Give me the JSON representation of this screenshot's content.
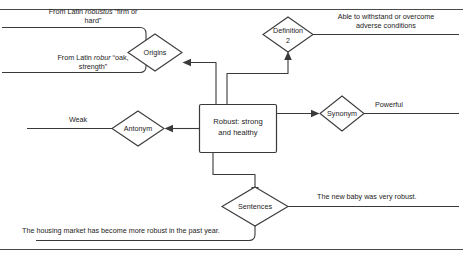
{
  "diagram": {
    "type": "concept-map",
    "stroke_color": "#3a3a3a",
    "background_color": "#ffffff",
    "center": {
      "label_line1": "Robust: strong",
      "label_line2": "and healthy",
      "full_label": "Robust: strong and healthy"
    },
    "nodes": [
      {
        "id": "origins",
        "label": "Origins",
        "shape": "diamond"
      },
      {
        "id": "definition2",
        "label_line1": "Definition",
        "label_line2": "2",
        "full_label": "Definition 2",
        "shape": "diamond"
      },
      {
        "id": "synonym",
        "label": "Synonym",
        "shape": "diamond"
      },
      {
        "id": "antonym",
        "label": "Antonym",
        "shape": "diamond"
      },
      {
        "id": "sentences",
        "label": "Sentences",
        "shape": "diamond"
      }
    ],
    "leaves": {
      "origin_1_pre": "From Latin ",
      "origin_1_italic": "robustus",
      "origin_1_post": " “firm or",
      "origin_1_line2": "hard”",
      "origin_2_pre": "From Latin ",
      "origin_2_italic": "robur",
      "origin_2_post": " “oak,",
      "origin_2_line2": "strength”",
      "definition_2_line1": "Able to withstand or overcome",
      "definition_2_line2": "adverse conditions",
      "synonym_value": "Powerful",
      "antonym_value": "Weak",
      "sentence_1": "The new baby was very robust.",
      "sentence_2": "The housing market has become more robust in the past year."
    }
  }
}
